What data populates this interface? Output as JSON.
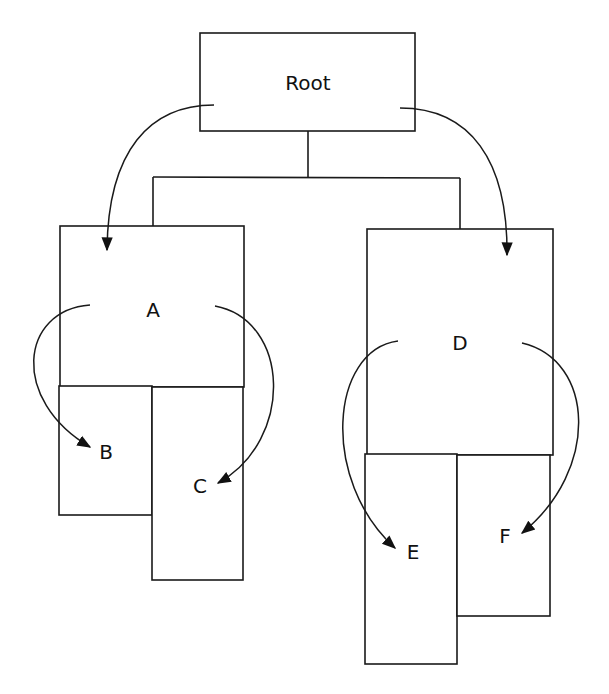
{
  "diagram": {
    "type": "tree",
    "nodes": [
      {
        "id": "root",
        "label": "Root"
      },
      {
        "id": "a",
        "label": "A"
      },
      {
        "id": "b",
        "label": "B"
      },
      {
        "id": "c",
        "label": "C"
      },
      {
        "id": "d",
        "label": "D"
      },
      {
        "id": "e",
        "label": "E"
      },
      {
        "id": "f",
        "label": "F"
      }
    ],
    "edges": [
      {
        "from": "Root",
        "to": "A"
      },
      {
        "from": "Root",
        "to": "D"
      },
      {
        "from": "A",
        "to": "B"
      },
      {
        "from": "A",
        "to": "C"
      },
      {
        "from": "D",
        "to": "E"
      },
      {
        "from": "D",
        "to": "F"
      }
    ],
    "colors": {
      "stroke": "#1a1a1a",
      "background": "#ffffff",
      "text": "#111111"
    }
  }
}
